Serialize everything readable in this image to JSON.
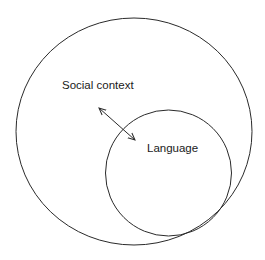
{
  "diagram": {
    "outer_circle": {
      "label": "Social context",
      "cx": 134,
      "cy": 131.5,
      "rx": 118,
      "ry": 113.5
    },
    "inner_circle": {
      "label": "Language",
      "cx": 168.5,
      "cy": 173,
      "r": 63
    },
    "relation": {
      "type": "bidirectional-arrow",
      "from": "Social context",
      "to": "Language"
    },
    "stroke_color": "#2a2a2a",
    "text_color": "#1a1a1a"
  }
}
